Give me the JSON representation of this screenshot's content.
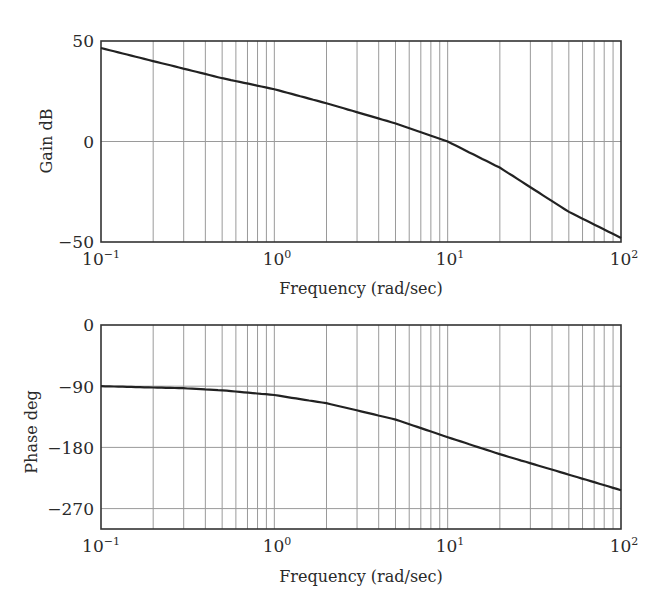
{
  "chart_data": [
    {
      "type": "line",
      "title": "",
      "xlabel": "Frequency (rad/sec)",
      "ylabel": "Gain dB",
      "xscale": "log",
      "xlim": [
        0.1,
        100
      ],
      "ylim": [
        -50,
        50
      ],
      "grid": true,
      "x_tick_labels": [
        "10^-1",
        "10^0",
        "10^1",
        "10^2"
      ],
      "y_tick_labels": [
        "50",
        "0",
        "-50"
      ],
      "y_ticks": [
        50,
        0,
        -50
      ],
      "series": [
        {
          "name": "Gain",
          "x": [
            0.1,
            0.2,
            0.5,
            1,
            2,
            5,
            10,
            20,
            50,
            100
          ],
          "values": [
            46.5,
            40,
            31.5,
            26,
            19,
            9,
            0,
            -13,
            -35,
            -48
          ]
        }
      ]
    },
    {
      "type": "line",
      "title": "",
      "xlabel": "Frequency (rad/sec)",
      "ylabel": "Phase deg",
      "xscale": "log",
      "xlim": [
        0.1,
        100
      ],
      "ylim": [
        -300,
        0
      ],
      "grid": true,
      "x_tick_labels": [
        "10^-1",
        "10^0",
        "10^1",
        "10^2"
      ],
      "y_tick_labels": [
        "0",
        "-90",
        "-180",
        "-270"
      ],
      "y_ticks": [
        0,
        -90,
        -180,
        -270
      ],
      "series": [
        {
          "name": "Phase",
          "x": [
            0.1,
            0.3,
            0.5,
            1,
            2,
            5,
            10,
            20,
            50,
            100
          ],
          "values": [
            -90,
            -93,
            -96,
            -103,
            -115,
            -139,
            -165,
            -190,
            -220,
            -243
          ]
        }
      ]
    }
  ],
  "gain_plot": {
    "ylabel": "Gain dB",
    "xlabel": "Frequency (rad/sec)",
    "yticks": [
      "50",
      "0",
      "−50"
    ]
  },
  "phase_plot": {
    "ylabel": "Phase deg",
    "xlabel": "Frequency (rad/sec)",
    "yticks": [
      "0",
      "−90",
      "−180",
      "−270"
    ]
  },
  "xticks": [
    {
      "base": "10",
      "exp": "−1"
    },
    {
      "base": "10",
      "exp": "0"
    },
    {
      "base": "10",
      "exp": "1"
    },
    {
      "base": "10",
      "exp": "2"
    }
  ],
  "colors": {
    "curve": "#222222",
    "frame": "#333333",
    "grid": "#9a9a9a"
  }
}
